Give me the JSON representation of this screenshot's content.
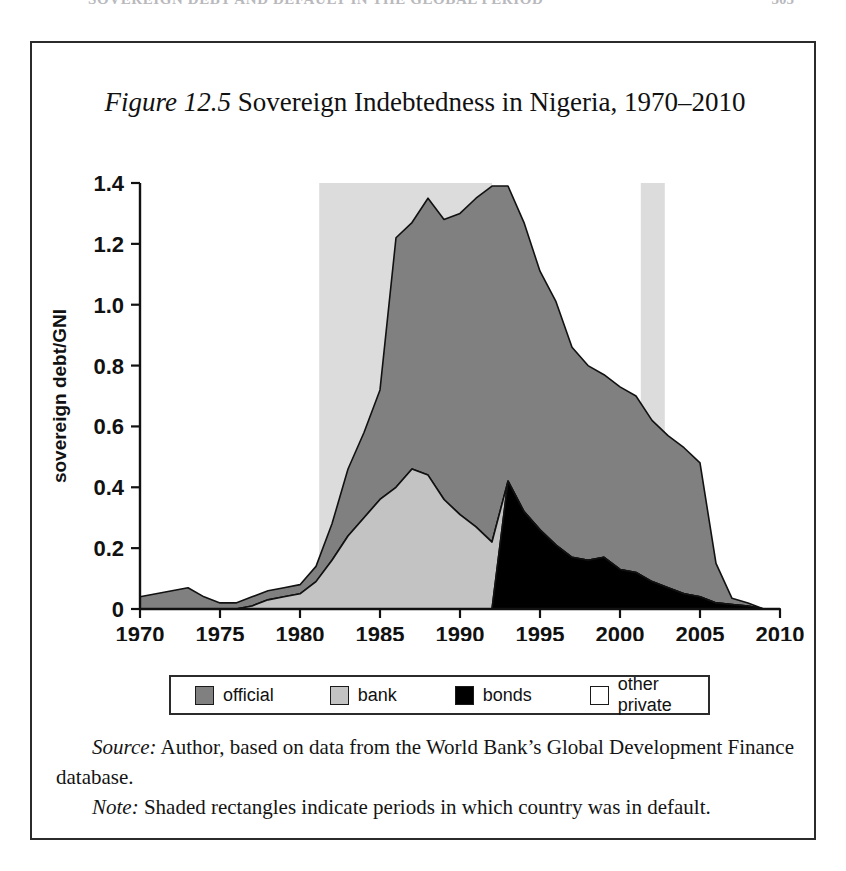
{
  "running_head": {
    "title": "SOVEREIGN DEBT AND DEFAULT IN THE GLOBAL PERIOD",
    "page_number": "305"
  },
  "figure": {
    "label": "Figure 12.5",
    "title": " Sovereign Indebtedness in Nigeria, 1970–2010"
  },
  "legend": {
    "items": [
      {
        "label": "official",
        "color": "#808080"
      },
      {
        "label": "bank",
        "color": "#c3c3c3"
      },
      {
        "label": "bonds",
        "color": "#000000"
      },
      {
        "label": "other private",
        "color": "#ffffff"
      }
    ]
  },
  "caption": {
    "source_label": "Source:",
    "source_text": " Author, based on data from the World Bank’s Global Development Finance database.",
    "note_label": "Note:",
    "note_text": " Shaded rectangles indicate periods in which country was in default."
  },
  "chart_data": {
    "type": "area",
    "stacked": true,
    "title": "Sovereign Indebtedness in Nigeria, 1970–2010",
    "xlabel": "",
    "ylabel": "sovereign debt/GNI",
    "xlim": [
      1970,
      2010
    ],
    "ylim": [
      0,
      1.4
    ],
    "xticks": [
      1970,
      1975,
      1980,
      1985,
      1990,
      1995,
      2000,
      2005,
      2010
    ],
    "yticks": [
      0,
      0.2,
      0.4,
      0.6,
      0.8,
      1.0,
      1.2,
      1.4
    ],
    "ytick_labels": [
      "0",
      "0.2",
      "0.4",
      "0.6",
      "0.8",
      "1.0",
      "1.2",
      "1.4"
    ],
    "grid": false,
    "legend_position": "below",
    "x": [
      1970,
      1971,
      1972,
      1973,
      1974,
      1975,
      1976,
      1977,
      1978,
      1979,
      1980,
      1981,
      1982,
      1983,
      1984,
      1985,
      1986,
      1987,
      1988,
      1989,
      1990,
      1991,
      1992,
      1993,
      1994,
      1995,
      1996,
      1997,
      1998,
      1999,
      2000,
      2001,
      2002,
      2003,
      2004,
      2005,
      2006,
      2007,
      2008,
      2009,
      2010
    ],
    "series": [
      {
        "name": "bonds",
        "color": "#000000",
        "values": [
          0,
          0,
          0,
          0,
          0,
          0,
          0,
          0,
          0,
          0,
          0,
          0,
          0,
          0,
          0,
          0,
          0,
          0,
          0,
          0,
          0,
          0,
          0,
          0.42,
          0.32,
          0.26,
          0.21,
          0.17,
          0.16,
          0.17,
          0.13,
          0.12,
          0.09,
          0.07,
          0.05,
          0.04,
          0.02,
          0.015,
          0.01,
          0,
          0
        ]
      },
      {
        "name": "bank",
        "color": "#c3c3c3",
        "values": [
          0,
          0,
          0,
          0,
          0,
          0,
          0,
          0.01,
          0.03,
          0.04,
          0.05,
          0.09,
          0.16,
          0.24,
          0.3,
          0.36,
          0.4,
          0.46,
          0.44,
          0.36,
          0.31,
          0.27,
          0.22,
          0,
          0,
          0,
          0,
          0,
          0,
          0,
          0,
          0,
          0,
          0,
          0,
          0,
          0,
          0,
          0,
          0,
          0
        ]
      },
      {
        "name": "official",
        "color": "#808080",
        "values": [
          0.04,
          0.05,
          0.06,
          0.07,
          0.04,
          0.02,
          0.02,
          0.03,
          0.03,
          0.03,
          0.03,
          0.05,
          0.12,
          0.22,
          0.28,
          0.36,
          0.82,
          0.81,
          0.91,
          0.92,
          0.99,
          1.08,
          1.17,
          0.97,
          0.95,
          0.85,
          0.8,
          0.69,
          0.64,
          0.6,
          0.6,
          0.58,
          0.53,
          0.5,
          0.48,
          0.44,
          0.13,
          0.02,
          0.01,
          0,
          0
        ]
      },
      {
        "name": "other private",
        "color": "#ffffff",
        "values": [
          0,
          0,
          0,
          0,
          0,
          0,
          0,
          0,
          0,
          0,
          0,
          0,
          0,
          0,
          0,
          0,
          0,
          0,
          0,
          0,
          0,
          0,
          0,
          0,
          0,
          0,
          0,
          0,
          0,
          0,
          0,
          0,
          0,
          0,
          0,
          0,
          0,
          0,
          0,
          0,
          0
        ]
      }
    ],
    "totals": [
      0.04,
      0.05,
      0.06,
      0.07,
      0.04,
      0.02,
      0.02,
      0.04,
      0.06,
      0.07,
      0.08,
      0.14,
      0.28,
      0.46,
      0.58,
      0.72,
      1.22,
      1.27,
      1.35,
      1.28,
      1.3,
      1.35,
      1.39,
      1.39,
      1.27,
      1.11,
      1.01,
      0.86,
      0.8,
      0.77,
      0.73,
      0.7,
      0.62,
      0.57,
      0.53,
      0.48,
      0.15,
      0.035,
      0.02,
      0,
      0
    ],
    "default_periods": [
      {
        "start": 1981.2,
        "end": 1992.0
      },
      {
        "start": 2001.3,
        "end": 2002.8
      }
    ],
    "default_shading_color": "#dcdcdc",
    "annotations": [
      "Shaded rectangles indicate periods in which country was in default."
    ]
  }
}
